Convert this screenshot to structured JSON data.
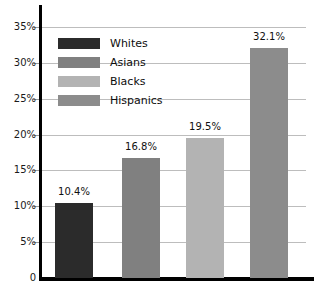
{
  "chart_data": {
    "type": "bar",
    "title": "",
    "xlabel": "",
    "ylabel": "",
    "categories": [
      "Whites",
      "Asians",
      "Blacks",
      "Hispanics"
    ],
    "values": [
      10.4,
      16.8,
      19.5,
      32.1
    ],
    "value_labels": [
      "10.4%",
      "16.8%",
      "19.5%",
      "32.1%"
    ],
    "ylim": [
      0,
      35
    ],
    "ytick_labels": [
      "0",
      "5%",
      "10%",
      "15%",
      "20%",
      "25%",
      "30%",
      "35%"
    ],
    "ytick_values": [
      0,
      5,
      10,
      15,
      20,
      25,
      30,
      35
    ],
    "grid": true,
    "legend_position": "top-left",
    "series_colors": [
      "#2b2b2b",
      "#808080",
      "#b3b3b3",
      "#8c8c8c"
    ],
    "legend": [
      {
        "label": "Whites",
        "color": "#2b2b2b"
      },
      {
        "label": "Asians",
        "color": "#808080"
      },
      {
        "label": "Blacks",
        "color": "#b3b3b3"
      },
      {
        "label": "Hispanics",
        "color": "#8c8c8c"
      }
    ]
  },
  "colors": {
    "axis": "#000000",
    "gridline": "#bdbdbd",
    "background": "#ffffff",
    "text": "#111111"
  }
}
